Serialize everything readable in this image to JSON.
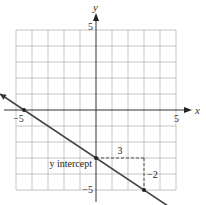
{
  "chart_data": {
    "type": "line",
    "title": "",
    "xlabel": "x",
    "ylabel": "y",
    "xlim": [
      -5,
      5
    ],
    "ylim": [
      -5,
      5
    ],
    "grid": true,
    "x_ticks": [
      {
        "value": -5,
        "label": "−5"
      },
      {
        "value": 5,
        "label": "5"
      }
    ],
    "y_ticks": [
      {
        "value": 5,
        "label": "5"
      },
      {
        "value": -5,
        "label": "−5"
      }
    ],
    "series": [
      {
        "name": "line",
        "equation": "y = -2/3 x - 3",
        "slope": -0.6667,
        "intercept": -3,
        "x_range": [
          -6,
          6.6
        ],
        "arrows": "both"
      }
    ],
    "points": [
      {
        "name": "x-intercept",
        "x": -4.5,
        "y": 0
      },
      {
        "name": "y-intercept",
        "x": 0,
        "y": -3
      },
      {
        "name": "second-point",
        "x": 3,
        "y": -5
      }
    ],
    "annotations": [
      {
        "text": "y intercept",
        "x": 0,
        "y": -3,
        "anchor": "left"
      },
      {
        "text": "3",
        "kind": "run",
        "from": [
          0,
          -3
        ],
        "to": [
          3,
          -3
        ]
      },
      {
        "text": "−2",
        "kind": "rise",
        "from": [
          3,
          -3
        ],
        "to": [
          3,
          -5
        ]
      }
    ]
  }
}
